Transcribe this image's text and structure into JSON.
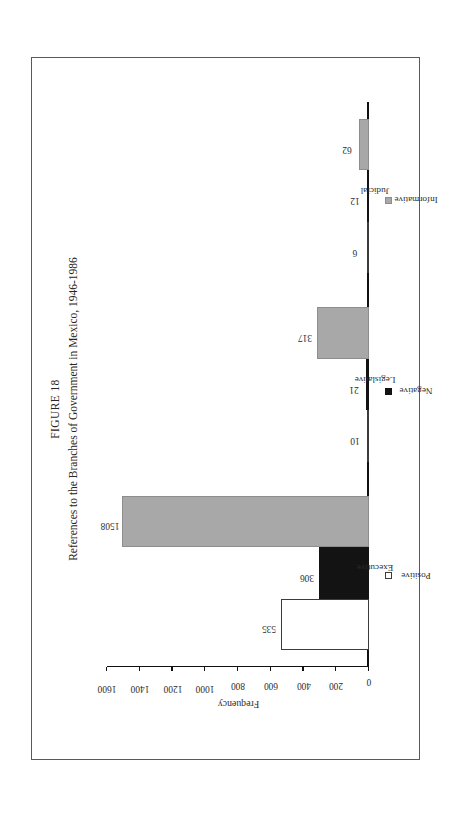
{
  "figure": {
    "number_label": "FIGURE 18",
    "caption": "References to the Branches of Government in Mexico, 1946-1986"
  },
  "chart_data": {
    "type": "bar",
    "title": "References to the Branches of Government in Mexico, 1946-1986",
    "subtitle": "FIGURE 18",
    "orientation": "vertical",
    "xlabel": "",
    "ylabel": "Frequency",
    "ylim": [
      0,
      1600
    ],
    "ytick_labels": [
      "0",
      "200",
      "400",
      "600",
      "800",
      "1000",
      "1200",
      "1400",
      "1600"
    ],
    "ytick_values": [
      0,
      200,
      400,
      600,
      800,
      1000,
      1200,
      1400,
      1600
    ],
    "grid": false,
    "legend_position": "bottom",
    "categories": [
      "Executive",
      "Legislative",
      "Judicial"
    ],
    "series": [
      {
        "name": "Positive",
        "color": "#ffffff",
        "values": [
          535,
          10,
          6
        ]
      },
      {
        "name": "Negative",
        "color": "#131313",
        "values": [
          306,
          21,
          12
        ]
      },
      {
        "name": "Informative",
        "color": "#a8a8a8",
        "values": [
          1508,
          317,
          62
        ]
      }
    ]
  },
  "colors": {
    "positive": "#ffffff",
    "negative": "#131313",
    "informative": "#a8a8a8",
    "axis": "#111111",
    "frame": "#5a5a5a",
    "page": "#ffffff"
  }
}
